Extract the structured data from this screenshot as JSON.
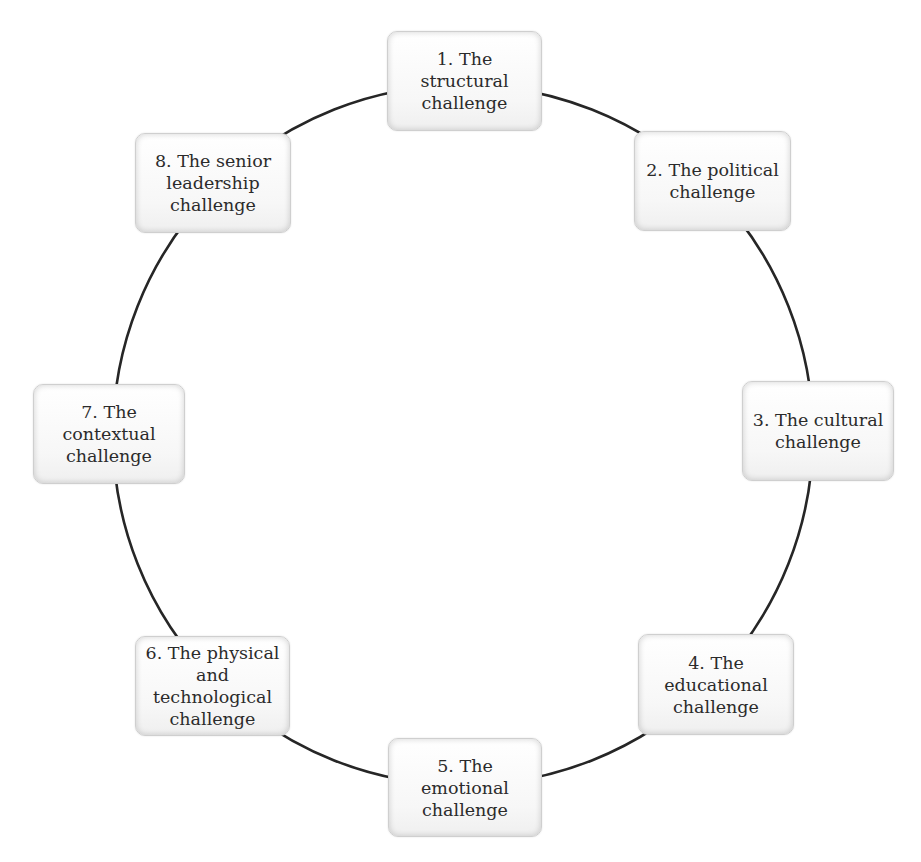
{
  "diagram": {
    "type": "cycle",
    "ring": {
      "cx": 463,
      "cy": 435,
      "r": 350,
      "stroke": "#262626",
      "stroke_width": 2.6
    },
    "nodes": [
      {
        "id": 1,
        "label": "1. The structural\nchallenge",
        "x": 387,
        "y": 31,
        "w": 155,
        "h": 100
      },
      {
        "id": 2,
        "label": "2. The political\nchallenge",
        "x": 634,
        "y": 131,
        "w": 157,
        "h": 100
      },
      {
        "id": 3,
        "label": "3. The cultural\nchallenge",
        "x": 742,
        "y": 381,
        "w": 152,
        "h": 100
      },
      {
        "id": 4,
        "label": "4. The\neducational\nchallenge",
        "x": 638,
        "y": 634,
        "w": 156,
        "h": 101
      },
      {
        "id": 5,
        "label": "5. The emotional\nchallenge",
        "x": 388,
        "y": 738,
        "w": 154,
        "h": 99
      },
      {
        "id": 6,
        "label": "6. The physical\nand\ntechnological\nchallenge",
        "x": 135,
        "y": 636,
        "w": 155,
        "h": 100
      },
      {
        "id": 7,
        "label": "7. The contextual\nchallenge",
        "x": 33,
        "y": 384,
        "w": 152,
        "h": 100
      },
      {
        "id": 8,
        "label": "8. The senior\nleadership\nchallenge",
        "x": 135,
        "y": 133,
        "w": 156,
        "h": 100
      }
    ]
  }
}
